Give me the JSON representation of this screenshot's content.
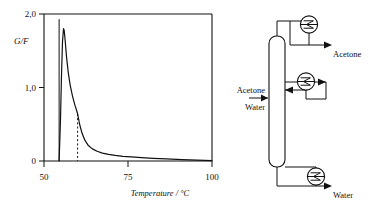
{
  "figure": {
    "panels": [
      "chart-panel",
      "flowsheet-panel"
    ]
  },
  "chart_data": {
    "type": "line",
    "title": "",
    "xlabel": "Temperature / °C",
    "ylabel": "G/F",
    "xlim": [
      50,
      100
    ],
    "ylim": [
      0,
      2.0
    ],
    "xticks": [
      50,
      75,
      100
    ],
    "xticklabels": [
      "50",
      "75",
      "100"
    ],
    "yticks": [
      0,
      1.0,
      2.0
    ],
    "yticklabels": [
      "0",
      "1,0",
      "2,0"
    ],
    "grid": false,
    "legend": null,
    "series": [
      {
        "name": "G/F",
        "x": [
          54.5,
          54.9,
          55.2,
          55.5,
          55.8,
          56.0,
          56.3,
          56.7,
          57.2,
          57.8,
          58.5,
          59.2,
          59.9,
          60.0,
          60.6,
          61.3,
          62.2,
          63.2,
          64.4,
          65.8,
          67.4,
          69.2,
          71.2,
          73.5,
          76.0,
          79.0,
          82.5,
          86.5,
          91.0,
          95.5,
          100.0
        ],
        "y": [
          0.0,
          0.55,
          1.15,
          1.62,
          1.8,
          1.78,
          1.64,
          1.42,
          1.21,
          1.03,
          0.88,
          0.76,
          0.66,
          0.64,
          0.5,
          0.38,
          0.28,
          0.21,
          0.165,
          0.132,
          0.108,
          0.09,
          0.076,
          0.064,
          0.055,
          0.046,
          0.037,
          0.028,
          0.02,
          0.012,
          0.004
        ]
      }
    ],
    "annotations": [
      {
        "type": "vline-solid",
        "x": 54.5,
        "note": "curve onset boiling point"
      },
      {
        "type": "vline-dashed",
        "x": 60.0,
        "y_top": 0.64,
        "note": "kink / transition temperature"
      }
    ]
  },
  "flowsheet": {
    "column": {
      "name": "distillation-column"
    },
    "units": [
      {
        "name": "condenser-top",
        "icon": "heat-exchanger-icon"
      },
      {
        "name": "side-heat-exchanger",
        "icon": "heat-exchanger-icon"
      },
      {
        "name": "reboiler-bottom",
        "icon": "heat-exchanger-icon"
      }
    ],
    "streams": [
      {
        "name": "feed-acetone",
        "label": "Acetone"
      },
      {
        "name": "feed-water",
        "label": "Water"
      },
      {
        "name": "product-acetone",
        "label": "Acetone"
      },
      {
        "name": "product-water",
        "label": "Water"
      }
    ]
  }
}
